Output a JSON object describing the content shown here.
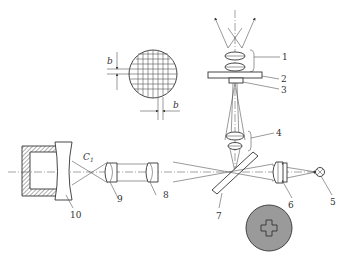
{
  "diagram": {
    "type": "optical-schematic",
    "labels": {
      "n1": "1",
      "n2": "2",
      "n3": "3",
      "n4": "4",
      "n5": "5",
      "n6": "6",
      "n7": "7",
      "n8": "8",
      "n9": "9",
      "n10": "10",
      "c1": "C",
      "c1_sub": "1",
      "grid_h": "b",
      "grid_w": "b"
    },
    "components": [
      {
        "id": "1",
        "desc": "eyepiece lens pair (top)"
      },
      {
        "id": "2",
        "desc": "reticle plate"
      },
      {
        "id": "3",
        "desc": "reticle mark"
      },
      {
        "id": "4",
        "desc": "relay lens pair"
      },
      {
        "id": "5",
        "desc": "light source"
      },
      {
        "id": "6",
        "desc": "condenser lens"
      },
      {
        "id": "7",
        "desc": "beam splitter"
      },
      {
        "id": "8",
        "desc": "lens"
      },
      {
        "id": "9",
        "desc": "lens"
      },
      {
        "id": "10",
        "desc": "concave mirror in housing"
      }
    ],
    "colors": {
      "line": "#333333",
      "disc_fill": "#9a9a9a",
      "background": "#ffffff"
    }
  }
}
